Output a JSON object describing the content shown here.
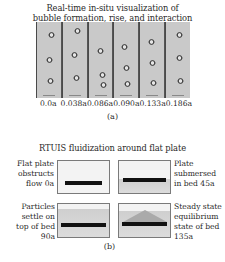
{
  "panel_a": {
    "title_line1": "Real-time in-situ visualization of",
    "title_line2": "bubble formation, rise, and interaction",
    "frame_labels": [
      "0.0a",
      "0.038a",
      "0.086a",
      "0.090a",
      "0.133a",
      "0.186a"
    ],
    "caption": "(a)"
  },
  "panel_b": {
    "title": "RTUIS fluidization around flat plate",
    "images": [
      {
        "desc_lines": [
          "Flat plate",
          "obstructs",
          "flow 0a"
        ]
      },
      {
        "desc_lines": [
          "Plate",
          "submersed",
          "in bed 45a"
        ]
      },
      {
        "desc_lines": [
          "Particles",
          "settle on",
          "top of bed 90a"
        ]
      },
      {
        "desc_lines": [
          "Steady state",
          "equilibrium",
          "state of bed",
          "135a"
        ]
      }
    ],
    "caption": "(b)"
  }
}
